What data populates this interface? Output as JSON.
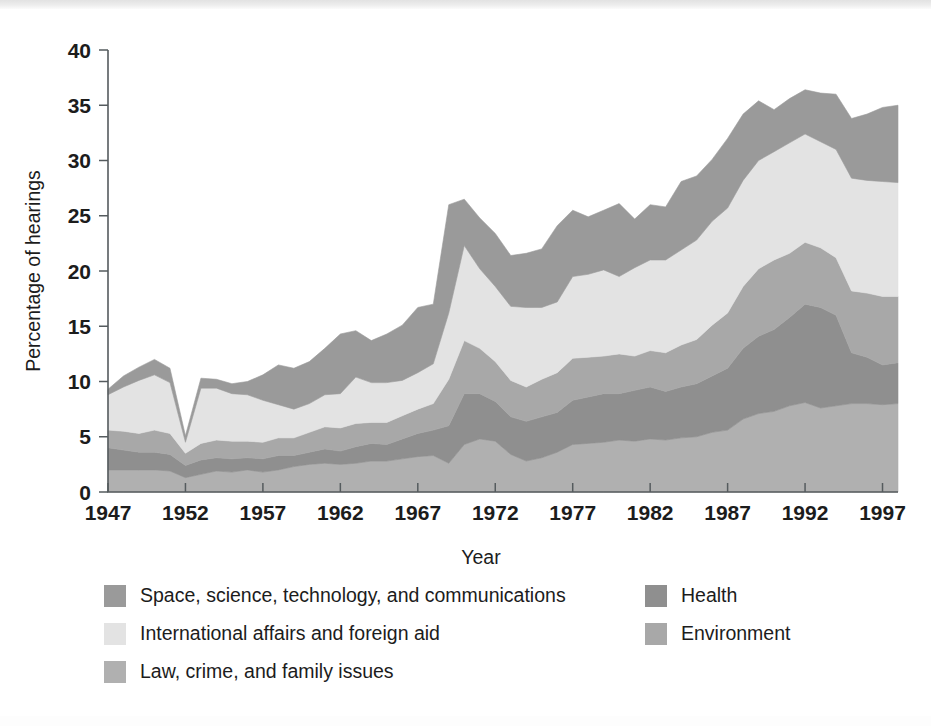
{
  "figure": {
    "axis_color": "#555b5e",
    "background": "#ffffff"
  },
  "chart_data": {
    "type": "area",
    "stacked": true,
    "title": "",
    "subtitle": "",
    "xlabel": "Year",
    "ylabel": "Percentage of hearings",
    "xlim": [
      1947,
      1998
    ],
    "ylim": [
      0,
      40
    ],
    "ytick_step": 5,
    "xtick_step": 5,
    "grid": false,
    "legend_position": "bottom",
    "xticks": [
      1947,
      1952,
      1957,
      1962,
      1967,
      1972,
      1977,
      1982,
      1987,
      1992,
      1997
    ],
    "yticks": [
      0,
      5,
      10,
      15,
      20,
      25,
      30,
      35,
      40
    ],
    "x": [
      1947,
      1948,
      1949,
      1950,
      1951,
      1952,
      1953,
      1954,
      1955,
      1956,
      1957,
      1958,
      1959,
      1960,
      1961,
      1962,
      1963,
      1964,
      1965,
      1966,
      1967,
      1968,
      1969,
      1970,
      1971,
      1972,
      1973,
      1974,
      1975,
      1976,
      1977,
      1978,
      1979,
      1980,
      1981,
      1982,
      1983,
      1984,
      1985,
      1986,
      1987,
      1988,
      1989,
      1990,
      1991,
      1992,
      1993,
      1994,
      1995,
      1996,
      1997,
      1998
    ],
    "series": [
      {
        "name": "Law, crime, and family issues",
        "color": "#b0b0b0",
        "stack_order": 1,
        "values": [
          2.0,
          2.0,
          2.0,
          2.0,
          1.9,
          1.3,
          1.6,
          1.9,
          1.8,
          2.0,
          1.8,
          2.0,
          2.3,
          2.5,
          2.6,
          2.5,
          2.6,
          2.8,
          2.8,
          3.0,
          3.2,
          3.3,
          2.6,
          4.3,
          4.8,
          4.6,
          3.4,
          2.8,
          3.1,
          3.6,
          4.3,
          4.4,
          4.5,
          4.7,
          4.6,
          4.8,
          4.7,
          4.9,
          5.0,
          5.4,
          5.6,
          6.6,
          7.1,
          7.3,
          7.8,
          8.1,
          7.6,
          7.8,
          8.0,
          8.0,
          7.9,
          8.0
        ]
      },
      {
        "name": "Health",
        "color": "#8f8f8f",
        "stack_order": 2,
        "values": [
          2.0,
          1.8,
          1.6,
          1.6,
          1.5,
          1.1,
          1.3,
          1.2,
          1.2,
          1.1,
          1.2,
          1.3,
          1.0,
          1.1,
          1.3,
          1.2,
          1.5,
          1.6,
          1.5,
          1.8,
          2.1,
          2.3,
          3.4,
          4.6,
          4.1,
          3.6,
          3.4,
          3.6,
          3.7,
          3.6,
          4.0,
          4.2,
          4.4,
          4.2,
          4.6,
          4.7,
          4.4,
          4.6,
          4.8,
          5.1,
          5.6,
          6.4,
          7.0,
          7.4,
          8.0,
          8.9,
          9.1,
          8.2,
          4.6,
          4.2,
          3.6,
          3.7
        ]
      },
      {
        "name": "Environment",
        "color": "#a8a8a8",
        "stack_order": 3,
        "values": [
          1.6,
          1.7,
          1.7,
          2.0,
          1.9,
          1.1,
          1.5,
          1.6,
          1.6,
          1.5,
          1.5,
          1.6,
          1.6,
          1.8,
          2.0,
          2.1,
          2.1,
          1.9,
          2.0,
          2.1,
          2.2,
          2.4,
          4.2,
          4.8,
          4.1,
          3.6,
          3.3,
          3.1,
          3.4,
          3.6,
          3.8,
          3.6,
          3.4,
          3.6,
          3.1,
          3.3,
          3.5,
          3.8,
          4.0,
          4.6,
          5.0,
          5.6,
          6.1,
          6.3,
          5.8,
          5.6,
          5.4,
          5.2,
          5.6,
          5.8,
          6.2,
          6.0
        ]
      },
      {
        "name": "International affairs and foreign aid",
        "color": "#e3e3e3",
        "stack_order": 4,
        "values": [
          3.2,
          4.0,
          4.8,
          5.0,
          4.6,
          1.0,
          5.0,
          4.7,
          4.3,
          4.2,
          3.8,
          3.0,
          2.6,
          2.6,
          2.9,
          3.1,
          4.2,
          3.6,
          3.6,
          3.2,
          3.3,
          3.6,
          6.0,
          8.6,
          7.2,
          6.8,
          6.7,
          7.2,
          6.5,
          6.4,
          7.4,
          7.5,
          7.8,
          7.0,
          8.0,
          8.2,
          8.4,
          8.6,
          9.0,
          9.4,
          9.5,
          9.6,
          9.8,
          9.8,
          10.0,
          9.8,
          9.6,
          9.8,
          10.2,
          10.2,
          10.4,
          10.3
        ]
      },
      {
        "name": "Space, science, technology, and communications",
        "color": "#9a9a9a",
        "stack_order": 5,
        "values": [
          0.5,
          1.0,
          1.2,
          1.4,
          1.3,
          0.6,
          0.9,
          0.8,
          0.9,
          1.2,
          2.3,
          3.6,
          3.7,
          3.8,
          4.2,
          5.4,
          4.2,
          3.8,
          4.4,
          5.0,
          5.9,
          5.4,
          9.8,
          4.2,
          4.6,
          4.8,
          4.6,
          4.9,
          5.3,
          6.9,
          6.0,
          5.2,
          5.4,
          6.6,
          4.4,
          5.0,
          4.8,
          6.2,
          5.8,
          5.6,
          6.3,
          6.0,
          5.4,
          3.8,
          4.0,
          4.0,
          4.4,
          5.0,
          5.4,
          6.0,
          6.7,
          7.0
        ]
      }
    ]
  },
  "legend": {
    "left_column": [
      {
        "label": "Space, science, technology, and communications",
        "color": "#9a9a9a",
        "swatch_name": "legend-swatch-space-science"
      },
      {
        "label": "International affairs and foreign aid",
        "color": "#e3e3e3",
        "swatch_name": "legend-swatch-international-affairs"
      },
      {
        "label": "Law, crime, and family issues",
        "color": "#b0b0b0",
        "swatch_name": "legend-swatch-law-crime"
      }
    ],
    "right_column": [
      {
        "label": "Health",
        "color": "#8f8f8f",
        "swatch_name": "legend-swatch-health"
      },
      {
        "label": "Environment",
        "color": "#a8a8a8",
        "swatch_name": "legend-swatch-environment"
      }
    ]
  }
}
